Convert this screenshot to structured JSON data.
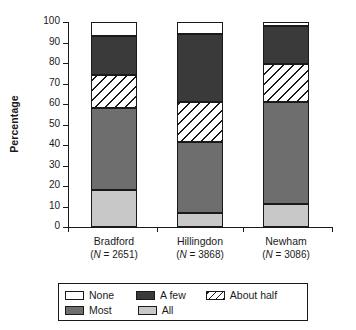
{
  "chart_data": {
    "type": "bar",
    "stacked": true,
    "title": "",
    "xlabel": "",
    "ylabel": "Percentage",
    "ylim": [
      0,
      100
    ],
    "ytick_labels": [
      "100",
      "90",
      "80",
      "70",
      "60",
      "50",
      "40",
      "30",
      "20",
      "10",
      "0"
    ],
    "ytick_values": [
      100,
      90,
      80,
      70,
      60,
      50,
      40,
      30,
      20,
      10,
      0
    ],
    "grid": false,
    "legend_position": "bottom",
    "categories": [
      "Bradford",
      "Hillingdon",
      "Newham"
    ],
    "category_sublabels": [
      "(N = 2651)",
      "(N = 3868)",
      "(N = 3086)"
    ],
    "category_n": [
      2651,
      3868,
      3086
    ],
    "series": [
      {
        "name": "None",
        "color": "#ffffff",
        "values": [
          7,
          6,
          2
        ]
      },
      {
        "name": "A few",
        "color": "#3a3a3a",
        "values": [
          19,
          33,
          18.5
        ]
      },
      {
        "name": "About half",
        "color": "hatched",
        "values": [
          16,
          19.5,
          18.5
        ]
      },
      {
        "name": "Most",
        "color": "#6e6e6e",
        "values": [
          40,
          34.5,
          50
        ]
      },
      {
        "name": "All",
        "color": "#c8c8c8",
        "values": [
          18,
          7,
          11
        ]
      }
    ],
    "cumulative_tops": {
      "Bradford": {
        "all": 18,
        "most": 58,
        "about_half": 74,
        "a_few": 93,
        "none": 100
      },
      "Hillingdon": {
        "all": 7,
        "most": 41.5,
        "about_half": 61,
        "a_few": 94,
        "none": 100
      },
      "Newham": {
        "all": 11,
        "most": 61,
        "about_half": 79.5,
        "a_few": 98,
        "none": 100
      }
    }
  },
  "legend": {
    "row1": [
      {
        "key": "none",
        "label": "None"
      },
      {
        "key": "afew",
        "label": "A few"
      },
      {
        "key": "abouthalf",
        "label": "About half"
      }
    ],
    "row2": [
      {
        "key": "most",
        "label": "Most"
      },
      {
        "key": "all",
        "label": "All"
      }
    ]
  },
  "axis": {
    "y_title": "Percentage"
  }
}
